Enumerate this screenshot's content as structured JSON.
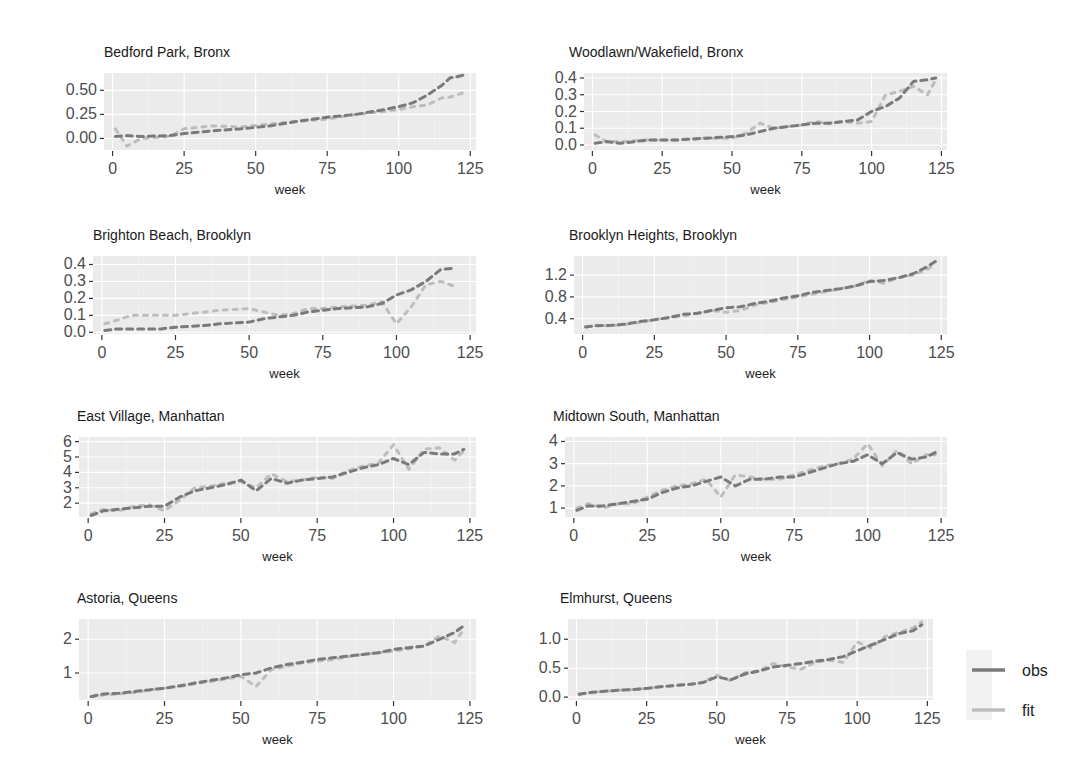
{
  "chart_data": {
    "type": "line",
    "layout": "facet_wrap 4 rows x 2 cols",
    "xlabel": "week",
    "x_ticks": [
      0,
      25,
      50,
      75,
      100,
      125
    ],
    "xlim": [
      -3,
      127
    ],
    "grid": true,
    "legend": {
      "position": "right",
      "entries": [
        {
          "name": "obs",
          "color": "#7a7a7a"
        },
        {
          "name": "fit",
          "color": "#bdbdbd"
        }
      ]
    },
    "panels": [
      {
        "title": "Bedford Park, Bronx",
        "ylim": [
          -0.12,
          0.68
        ],
        "y_ticks": [
          0.0,
          0.25,
          0.5
        ],
        "y_tick_labels": [
          "0.00",
          "0.25",
          "0.50"
        ],
        "series": [
          {
            "name": "obs",
            "x": [
              1,
              5,
              10,
              20,
              25,
              35,
              45,
              55,
              65,
              75,
              85,
              95,
              100,
              105,
              110,
              115,
              118,
              120,
              123
            ],
            "values": [
              0.02,
              0.03,
              0.02,
              0.03,
              0.05,
              0.08,
              0.1,
              0.13,
              0.18,
              0.22,
              0.25,
              0.3,
              0.33,
              0.37,
              0.45,
              0.55,
              0.63,
              0.64,
              0.66
            ]
          },
          {
            "name": "fit",
            "x": [
              1,
              5,
              10,
              20,
              25,
              35,
              45,
              55,
              65,
              75,
              85,
              95,
              100,
              105,
              110,
              115,
              118,
              120,
              123
            ],
            "values": [
              0.1,
              -0.08,
              0.0,
              0.02,
              0.1,
              0.13,
              0.12,
              0.15,
              0.18,
              0.2,
              0.25,
              0.28,
              0.3,
              0.33,
              0.35,
              0.42,
              0.43,
              0.45,
              0.48
            ]
          }
        ]
      },
      {
        "title": "Woodlawn/Wakefield, Bronx",
        "ylim": [
          -0.03,
          0.43
        ],
        "y_ticks": [
          0.0,
          0.1,
          0.2,
          0.3,
          0.4
        ],
        "y_tick_labels": [
          "0.0",
          "0.1",
          "0.2",
          "0.3",
          "0.4"
        ],
        "series": [
          {
            "name": "obs",
            "x": [
              1,
              5,
              10,
              20,
              30,
              40,
              50,
              55,
              60,
              65,
              70,
              75,
              80,
              85,
              90,
              95,
              100,
              105,
              110,
              115,
              120,
              123
            ],
            "values": [
              0.01,
              0.02,
              0.01,
              0.03,
              0.03,
              0.04,
              0.05,
              0.06,
              0.08,
              0.1,
              0.11,
              0.12,
              0.13,
              0.13,
              0.14,
              0.15,
              0.2,
              0.23,
              0.28,
              0.38,
              0.39,
              0.4
            ]
          },
          {
            "name": "fit",
            "x": [
              1,
              5,
              10,
              20,
              30,
              40,
              50,
              55,
              60,
              65,
              70,
              75,
              80,
              85,
              90,
              95,
              100,
              105,
              110,
              115,
              120,
              123
            ],
            "values": [
              0.06,
              0.02,
              0.02,
              0.03,
              0.03,
              0.04,
              0.04,
              0.07,
              0.13,
              0.1,
              0.11,
              0.12,
              0.14,
              0.13,
              0.14,
              0.13,
              0.14,
              0.3,
              0.32,
              0.35,
              0.3,
              0.39
            ]
          }
        ]
      },
      {
        "title": "Brighton Beach, Brooklyn",
        "ylim": [
          -0.01,
          0.45
        ],
        "y_ticks": [
          0.0,
          0.1,
          0.2,
          0.3,
          0.4
        ],
        "y_tick_labels": [
          "0.0",
          "0.1",
          "0.2",
          "0.3",
          "0.4"
        ],
        "series": [
          {
            "name": "obs",
            "x": [
              1,
              5,
              10,
              20,
              25,
              35,
              40,
              50,
              55,
              60,
              65,
              70,
              75,
              80,
              90,
              95,
              100,
              105,
              110,
              115,
              120
            ],
            "values": [
              0.01,
              0.02,
              0.02,
              0.02,
              0.03,
              0.04,
              0.05,
              0.06,
              0.08,
              0.09,
              0.1,
              0.12,
              0.13,
              0.14,
              0.15,
              0.17,
              0.22,
              0.25,
              0.3,
              0.37,
              0.38
            ]
          },
          {
            "name": "fit",
            "x": [
              1,
              5,
              10,
              20,
              25,
              35,
              40,
              50,
              55,
              60,
              65,
              70,
              75,
              80,
              90,
              95,
              100,
              105,
              110,
              115,
              120
            ],
            "values": [
              0.05,
              0.07,
              0.1,
              0.1,
              0.1,
              0.12,
              0.13,
              0.14,
              0.12,
              0.1,
              0.11,
              0.14,
              0.14,
              0.15,
              0.16,
              0.18,
              0.05,
              0.15,
              0.28,
              0.3,
              0.27
            ]
          }
        ]
      },
      {
        "title": "Brooklyn Heights, Brooklyn",
        "ylim": [
          0.12,
          1.55
        ],
        "y_ticks": [
          0.4,
          0.8,
          1.2
        ],
        "y_tick_labels": [
          "0.4",
          "0.8",
          "1.2"
        ],
        "series": [
          {
            "name": "obs",
            "x": [
              1,
              5,
              10,
              15,
              20,
              25,
              30,
              35,
              40,
              45,
              50,
              55,
              60,
              65,
              70,
              75,
              80,
              85,
              90,
              95,
              100,
              105,
              110,
              115,
              120,
              123
            ],
            "values": [
              0.25,
              0.27,
              0.28,
              0.3,
              0.35,
              0.38,
              0.42,
              0.48,
              0.5,
              0.55,
              0.6,
              0.62,
              0.68,
              0.72,
              0.78,
              0.82,
              0.88,
              0.92,
              0.95,
              1.0,
              1.08,
              1.1,
              1.15,
              1.22,
              1.35,
              1.45
            ]
          },
          {
            "name": "fit",
            "x": [
              1,
              5,
              10,
              15,
              20,
              25,
              30,
              35,
              40,
              45,
              50,
              55,
              60,
              65,
              70,
              75,
              80,
              85,
              90,
              95,
              100,
              105,
              110,
              115,
              120,
              123
            ],
            "values": [
              0.25,
              0.28,
              0.27,
              0.3,
              0.33,
              0.38,
              0.42,
              0.45,
              0.5,
              0.55,
              0.52,
              0.55,
              0.65,
              0.7,
              0.75,
              0.8,
              0.85,
              0.9,
              0.95,
              1.0,
              1.1,
              1.05,
              1.15,
              1.2,
              1.3,
              1.4
            ]
          }
        ]
      },
      {
        "title": "East Village, Manhattan",
        "ylim": [
          1.1,
          6.3
        ],
        "y_ticks": [
          2,
          3,
          4,
          5,
          6
        ],
        "y_tick_labels": [
          "2",
          "3",
          "4",
          "5",
          "6"
        ],
        "series": [
          {
            "name": "obs",
            "x": [
              1,
              5,
              10,
              15,
              20,
              25,
              30,
              35,
              40,
              45,
              50,
              55,
              60,
              65,
              70,
              75,
              80,
              85,
              90,
              95,
              100,
              105,
              110,
              115,
              120,
              123
            ],
            "values": [
              1.2,
              1.5,
              1.6,
              1.7,
              1.8,
              1.8,
              2.4,
              2.8,
              3.0,
              3.2,
              3.5,
              2.8,
              3.6,
              3.3,
              3.5,
              3.6,
              3.7,
              4.0,
              4.3,
              4.5,
              4.9,
              4.5,
              5.3,
              5.2,
              5.2,
              5.5
            ]
          },
          {
            "name": "fit",
            "x": [
              1,
              5,
              10,
              15,
              20,
              25,
              30,
              35,
              40,
              45,
              50,
              55,
              60,
              65,
              70,
              75,
              80,
              85,
              90,
              95,
              100,
              105,
              110,
              115,
              120,
              123
            ],
            "values": [
              1.3,
              1.6,
              1.5,
              1.8,
              1.9,
              1.5,
              2.2,
              3.0,
              3.1,
              3.3,
              3.4,
              3.0,
              3.9,
              3.4,
              3.5,
              3.7,
              3.6,
              4.1,
              4.4,
              4.6,
              5.8,
              4.2,
              5.5,
              5.6,
              4.8,
              5.4
            ]
          }
        ]
      },
      {
        "title": "Midtown South, Manhattan",
        "ylim": [
          0.6,
          4.2
        ],
        "y_ticks": [
          1,
          2,
          3,
          4
        ],
        "y_tick_labels": [
          "1",
          "2",
          "3",
          "4"
        ],
        "series": [
          {
            "name": "obs",
            "x": [
              1,
              5,
              10,
              15,
              20,
              25,
              30,
              35,
              40,
              45,
              50,
              55,
              60,
              65,
              70,
              75,
              80,
              85,
              90,
              95,
              100,
              105,
              110,
              115,
              120,
              123
            ],
            "values": [
              0.9,
              1.1,
              1.1,
              1.2,
              1.3,
              1.4,
              1.7,
              1.9,
              2.0,
              2.2,
              2.4,
              2.0,
              2.3,
              2.3,
              2.4,
              2.4,
              2.6,
              2.8,
              3.0,
              3.1,
              3.4,
              3.0,
              3.5,
              3.2,
              3.3,
              3.5
            ]
          },
          {
            "name": "fit",
            "x": [
              1,
              5,
              10,
              15,
              20,
              25,
              30,
              35,
              40,
              45,
              50,
              55,
              60,
              65,
              70,
              75,
              80,
              85,
              90,
              95,
              100,
              105,
              110,
              115,
              120,
              123
            ],
            "values": [
              1.0,
              1.2,
              1.0,
              1.2,
              1.2,
              1.5,
              1.8,
              2.0,
              2.1,
              2.3,
              1.5,
              2.5,
              2.4,
              2.3,
              2.3,
              2.5,
              2.7,
              2.9,
              3.0,
              3.2,
              3.9,
              2.9,
              3.6,
              3.0,
              3.4,
              3.4
            ]
          }
        ]
      },
      {
        "title": "Astoria, Queens",
        "ylim": [
          0.2,
          2.6
        ],
        "y_ticks": [
          1,
          2
        ],
        "y_tick_labels": [
          "1",
          "2"
        ],
        "series": [
          {
            "name": "obs",
            "x": [
              1,
              5,
              10,
              15,
              20,
              25,
              30,
              35,
              40,
              45,
              50,
              55,
              60,
              65,
              70,
              75,
              80,
              85,
              90,
              95,
              100,
              105,
              110,
              115,
              120,
              123
            ],
            "values": [
              0.3,
              0.38,
              0.4,
              0.45,
              0.5,
              0.55,
              0.62,
              0.7,
              0.78,
              0.85,
              0.95,
              1.0,
              1.15,
              1.25,
              1.32,
              1.4,
              1.45,
              1.5,
              1.55,
              1.6,
              1.7,
              1.75,
              1.8,
              2.0,
              2.2,
              2.4
            ]
          },
          {
            "name": "fit",
            "x": [
              1,
              5,
              10,
              15,
              20,
              25,
              30,
              35,
              40,
              45,
              50,
              55,
              60,
              65,
              70,
              75,
              80,
              85,
              90,
              95,
              100,
              105,
              110,
              115,
              120,
              123
            ],
            "values": [
              0.3,
              0.35,
              0.38,
              0.42,
              0.5,
              0.55,
              0.6,
              0.68,
              0.75,
              0.82,
              0.9,
              0.6,
              1.1,
              1.2,
              1.3,
              1.35,
              1.4,
              1.48,
              1.55,
              1.6,
              1.65,
              1.72,
              1.8,
              2.1,
              1.9,
              2.3
            ]
          }
        ]
      },
      {
        "title": "Elmhurst, Queens",
        "ylim": [
          -0.05,
          1.35
        ],
        "y_ticks": [
          0.0,
          0.5,
          1.0
        ],
        "y_tick_labels": [
          "0.0",
          "0.5",
          "1.0"
        ],
        "series": [
          {
            "name": "obs",
            "x": [
              1,
              5,
              10,
              15,
              20,
              25,
              30,
              35,
              40,
              45,
              50,
              55,
              60,
              65,
              70,
              75,
              80,
              85,
              90,
              95,
              100,
              105,
              110,
              115,
              120,
              123
            ],
            "values": [
              0.05,
              0.08,
              0.1,
              0.12,
              0.13,
              0.15,
              0.18,
              0.2,
              0.22,
              0.25,
              0.35,
              0.3,
              0.4,
              0.45,
              0.52,
              0.55,
              0.58,
              0.62,
              0.65,
              0.7,
              0.8,
              0.9,
              1.0,
              1.1,
              1.15,
              1.25
            ]
          },
          {
            "name": "fit",
            "x": [
              1,
              5,
              10,
              15,
              20,
              25,
              30,
              35,
              40,
              45,
              50,
              55,
              60,
              65,
              70,
              75,
              80,
              85,
              90,
              95,
              100,
              105,
              110,
              115,
              120,
              123
            ],
            "values": [
              0.05,
              0.08,
              0.1,
              0.12,
              0.13,
              0.15,
              0.18,
              0.2,
              0.22,
              0.25,
              0.38,
              0.28,
              0.42,
              0.45,
              0.58,
              0.52,
              0.48,
              0.6,
              0.64,
              0.6,
              0.95,
              0.85,
              1.05,
              1.12,
              1.2,
              1.3
            ]
          }
        ]
      }
    ]
  }
}
